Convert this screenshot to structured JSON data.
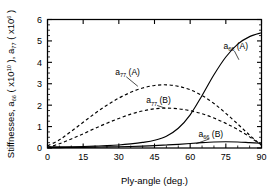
{
  "chart_data": {
    "type": "line",
    "title": "",
    "xlabel": "Ply-angle (deg.)",
    "ylabel": "Stiffnesses, a66 ( x10^10 ), a77 ( x10^6 )",
    "ylabel_parts": {
      "prefix": "Stiffnesses,  a",
      "sub1": "66",
      "mid": " ( x10",
      "sup1": "10",
      "mid2": " ), a",
      "sub2": "77",
      "mid3": " ( x10",
      "sup2": "6",
      "suffix": " )"
    },
    "xlim": [
      0,
      90
    ],
    "ylim": [
      0,
      6
    ],
    "xticks": [
      0,
      15,
      30,
      45,
      60,
      75,
      90
    ],
    "xtick_labels": [
      "0",
      "15",
      "30",
      "45",
      "60",
      "75",
      "90"
    ],
    "yticks": [
      0,
      1,
      2,
      3,
      4,
      5,
      6
    ],
    "ytick_labels": [
      "0",
      "1",
      "2",
      "3",
      "4",
      "5",
      "6"
    ],
    "x_minor_interval": 5,
    "y_minor_interval": 0.25,
    "grid": false,
    "legend": "inline-annotations",
    "x": [
      0,
      5,
      10,
      15,
      20,
      25,
      30,
      35,
      40,
      45,
      50,
      55,
      60,
      65,
      70,
      75,
      80,
      85,
      90
    ],
    "series": [
      {
        "name": "a66 (A)",
        "label_base": "a",
        "label_sub": "66",
        "label_suffix": " (A)",
        "style": "solid",
        "color": "#000000",
        "values": [
          0.05,
          0.05,
          0.06,
          0.07,
          0.09,
          0.11,
          0.14,
          0.19,
          0.26,
          0.36,
          0.55,
          0.92,
          1.55,
          2.45,
          3.42,
          4.25,
          4.85,
          5.2,
          5.38
        ],
        "annotation": {
          "x": 74,
          "y": 4.62,
          "leader_to_x": 80.5,
          "leader_to_y": 4.12
        }
      },
      {
        "name": "a66 (B)",
        "label_base": "a",
        "label_sub": "66",
        "label_suffix": " (B)",
        "style": "solid",
        "color": "#000000",
        "values": [
          0.02,
          0.02,
          0.03,
          0.03,
          0.04,
          0.05,
          0.06,
          0.07,
          0.09,
          0.11,
          0.14,
          0.17,
          0.21,
          0.25,
          0.28,
          0.29,
          0.28,
          0.25,
          0.22
        ],
        "annotation": {
          "x": 63.5,
          "y": 0.52,
          "leader_to_x": 62.5,
          "leader_to_y": 0.2
        }
      },
      {
        "name": "a77 (A)",
        "label_base": "a",
        "label_sub": "77",
        "label_suffix": " (A)",
        "style": "dashed",
        "color": "#000000",
        "values": [
          0.1,
          0.38,
          0.78,
          1.2,
          1.62,
          2.0,
          2.33,
          2.6,
          2.8,
          2.92,
          2.95,
          2.88,
          2.72,
          2.45,
          2.08,
          1.62,
          1.12,
          0.6,
          0.12
        ],
        "annotation": {
          "x": 28.5,
          "y": 3.42,
          "leader_to_x": 38.0,
          "leader_to_y": 2.88
        }
      },
      {
        "name": "a77 (B)",
        "label_base": "a",
        "label_sub": "77",
        "label_suffix": " (B)",
        "style": "dashed",
        "color": "#000000",
        "values": [
          0.02,
          0.2,
          0.42,
          0.66,
          0.92,
          1.16,
          1.38,
          1.58,
          1.73,
          1.83,
          1.86,
          1.83,
          1.74,
          1.6,
          1.4,
          1.15,
          0.86,
          0.52,
          0.14
        ],
        "annotation": {
          "x": 41.5,
          "y": 2.08,
          "leader_to_x": 49.5,
          "leader_to_y": 1.86
        }
      }
    ]
  },
  "figure": {
    "background_color": "#ffffff",
    "foreground_color": "#000000"
  }
}
